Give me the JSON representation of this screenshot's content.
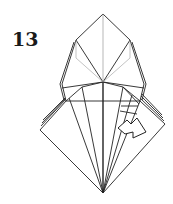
{
  "diagram": {
    "step_number": "13",
    "colors": {
      "line": "#222222",
      "light_line": "#9a9a9a",
      "paper": "#ffffff"
    },
    "elements": [
      {
        "name": "top-kite",
        "description": "upper diamond flap with center crease"
      },
      {
        "name": "side-flaps",
        "description": "layered left and right flaps"
      },
      {
        "name": "lower-square",
        "description": "large lower diamond with radiating creases"
      },
      {
        "name": "fold-arrow",
        "description": "hollow arrow pointing right indicating fold direction"
      }
    ]
  }
}
